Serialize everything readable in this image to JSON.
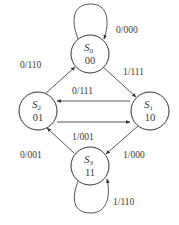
{
  "diagram": {
    "type": "state-diagram",
    "states": [
      {
        "id": "S0",
        "name": "S",
        "sub": "0",
        "code": "00"
      },
      {
        "id": "S1",
        "name": "S",
        "sub": "1",
        "code": "10"
      },
      {
        "id": "S2",
        "name": "S",
        "sub": "2",
        "code": "01"
      },
      {
        "id": "S3",
        "name": "S",
        "sub": "3",
        "code": "11"
      }
    ],
    "transitions": [
      {
        "from": "S0",
        "to": "S0",
        "label": "0/000"
      },
      {
        "from": "S0",
        "to": "S1",
        "label": "1/111"
      },
      {
        "from": "S1",
        "to": "S2",
        "label": "0/111"
      },
      {
        "from": "S2",
        "to": "S1",
        "label": "1/001"
      },
      {
        "from": "S2",
        "to": "S0",
        "label": "0/110"
      },
      {
        "from": "S1",
        "to": "S3",
        "label": "1/000"
      },
      {
        "from": "S3",
        "to": "S2",
        "label": "0/001"
      },
      {
        "from": "S3",
        "to": "S3",
        "label": "1/110"
      }
    ]
  }
}
